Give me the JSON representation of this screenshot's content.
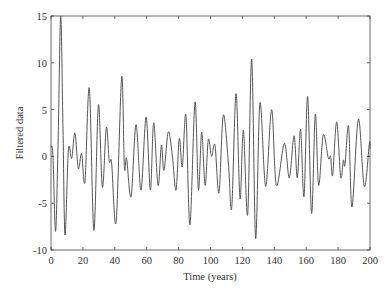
{
  "chart_data": {
    "type": "line",
    "title": "",
    "xlabel": "Time (years)",
    "ylabel": "Filtered data",
    "xlim": [
      0,
      200
    ],
    "ylim": [
      -10,
      15
    ],
    "xticks": [
      0,
      20,
      40,
      60,
      80,
      100,
      120,
      140,
      160,
      180,
      200
    ],
    "yticks": [
      -10,
      -5,
      0,
      5,
      10,
      15
    ],
    "grid": false,
    "legend": null,
    "line_color": "#555555",
    "series": [
      {
        "name": "Filtered data",
        "x": [
          0,
          1.2,
          2.9,
          4.5,
          6.1,
          7.5,
          8.8,
          10.9,
          13,
          15,
          17.1,
          19.2,
          21.3,
          24,
          26.9,
          29.7,
          32.2,
          34.7,
          36.5,
          38,
          40.8,
          44.3,
          46,
          47.4,
          50.2,
          53.3,
          56.4,
          59.6,
          62.3,
          64.4,
          67.1,
          69.2,
          70.8,
          73.5,
          75.9,
          78.4,
          80.4,
          82.3,
          84.6,
          87.1,
          90.3,
          92.4,
          94.5,
          96.6,
          98.6,
          100.7,
          102.8,
          105.3,
          108,
          111.2,
          113.3,
          116,
          118.5,
          120.6,
          123.3,
          125.8,
          128.3,
          131,
          134.6,
          138.3,
          141.3,
          146.3,
          149.4,
          152.4,
          154.4,
          156.5,
          158.6,
          160.9,
          163.4,
          165.7,
          167.8,
          170.7,
          173.9,
          175.3,
          176.6,
          179.1,
          181.6,
          183.3,
          184.3,
          186.6,
          188.7,
          192.7,
          196.4,
          199.6,
          200
        ],
        "values": [
          1.0,
          0.2,
          -8.0,
          2.0,
          15.0,
          3.0,
          -8.4,
          0.7,
          -0.2,
          2.5,
          -1.3,
          0.3,
          -2.7,
          7.3,
          -7.9,
          5.5,
          -3.3,
          3.1,
          -0.5,
          -0.7,
          -7.0,
          8.5,
          -1.1,
          -0.2,
          -4.3,
          3.4,
          -3.6,
          4.2,
          -3.6,
          3.6,
          -3.1,
          1.2,
          -1.5,
          2.6,
          0.3,
          -3.6,
          1.9,
          -1.1,
          4.4,
          -7.3,
          5.8,
          -3.6,
          2.6,
          -3.1,
          1.8,
          0.0,
          1.2,
          -3.9,
          4.4,
          -0.7,
          -5.5,
          6.7,
          -4.5,
          2.8,
          -6.2,
          10.4,
          -8.75,
          5.7,
          -3.2,
          5.0,
          -3.1,
          1.4,
          -2.3,
          2.2,
          -2.3,
          2.9,
          -4.3,
          6.4,
          -6.1,
          4.5,
          -3.1,
          2.3,
          -0.2,
          0.0,
          -2.0,
          3.7,
          -2.2,
          -0.4,
          -0.9,
          3.2,
          -5.4,
          4.0,
          -3.2,
          1.4,
          0.8
        ]
      }
    ]
  }
}
